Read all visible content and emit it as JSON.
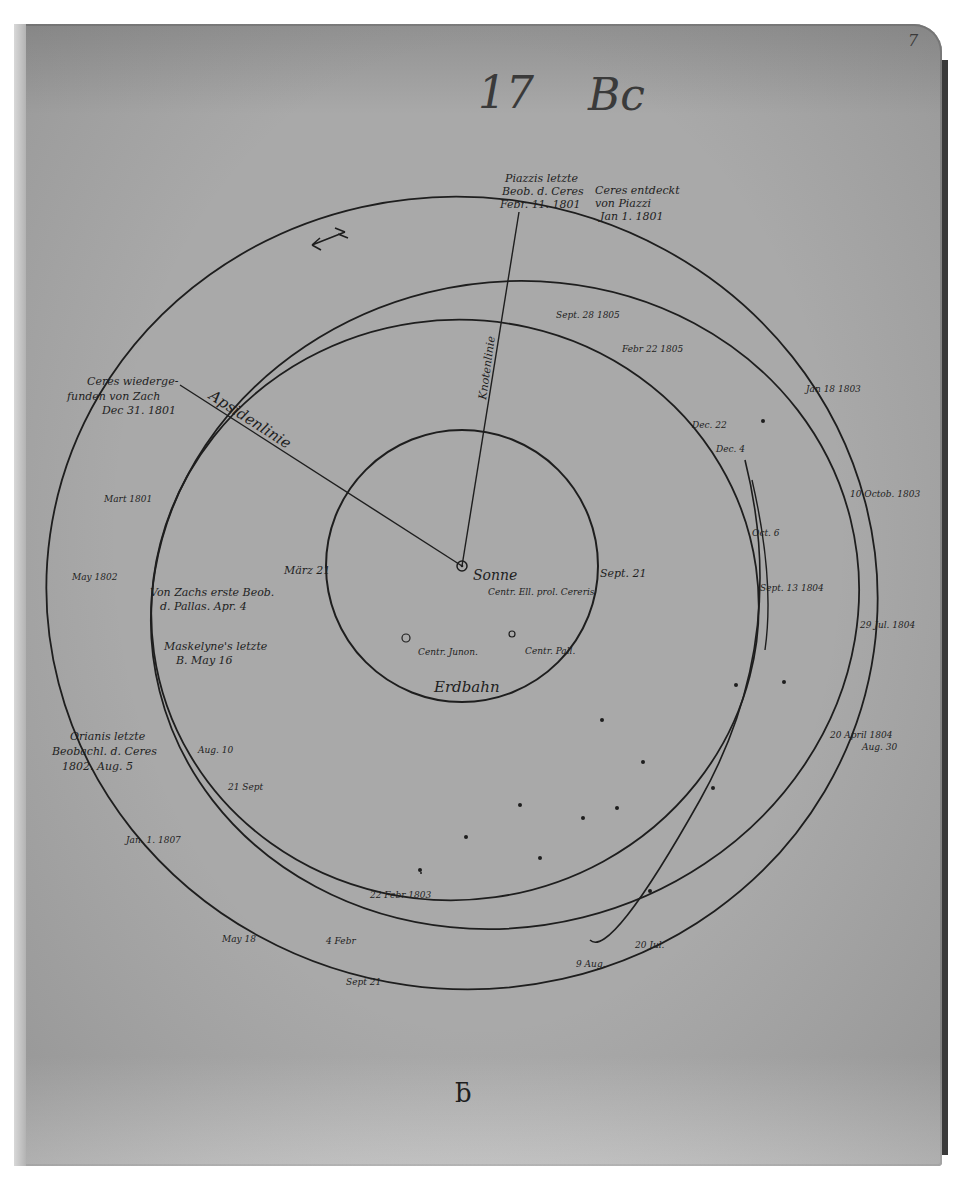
{
  "page": {
    "header_number": "17",
    "header_mark": "Bc",
    "corner_page_number": "7",
    "footer_glyph": "ƃ"
  },
  "diagram": {
    "center_label": "Sonne",
    "earth_orbit_label": "Erdbahn",
    "earth_points": {
      "march": "März 21",
      "sept": "Sept. 21"
    },
    "centers": {
      "ellipse_ceres": "Centr. Ell. prol. Cereris",
      "juno": "Centr. Junon.",
      "pallas": "Centr. Pall."
    },
    "lines": {
      "node_line": "Knotenlinie",
      "apse_line": "Apsidenlinie"
    },
    "annotations": [
      {
        "id": "piazzi-last",
        "lines": [
          "Piazzis letzte",
          "Beob. d. Ceres",
          "Febr. 11. 1801"
        ]
      },
      {
        "id": "ceres-discovered",
        "lines": [
          "Ceres entdeckt",
          "von Piazzi",
          "Jan 1. 1801"
        ]
      },
      {
        "id": "ceres-refound",
        "lines": [
          "Ceres wiederge-",
          "funden von Zach",
          "Dec 31. 1801"
        ]
      },
      {
        "id": "zach-first-pallas",
        "lines": [
          "Von Zachs erste Beob.",
          "d. Pallas. Apr. 4"
        ]
      },
      {
        "id": "maskelyne-last",
        "lines": [
          "Maskelyne's letzte",
          "B. May 16"
        ]
      },
      {
        "id": "orianis-last",
        "lines": [
          "Orianis letzte",
          "Beobachl. d. Ceres",
          "1802. Aug. 5"
        ]
      }
    ],
    "date_ticks": [
      "Sept. 28 1805",
      "Febr 22 1805",
      "Dec. 22",
      "Dec. 4",
      "Jan 18 1803",
      "Oct. 6",
      "Sept. 13 1804",
      "10 Octob. 1803",
      "29 Jul. 1804",
      "20 April 1804",
      "Aug. 30",
      "Mart 1801",
      "May 1802",
      "Aug. 10",
      "21 Sept",
      "Jan. 1. 1807",
      "22 Febr 1803",
      "4 Febr",
      "May 18",
      "Sept 21",
      "9 Aug.",
      "20 Jul."
    ]
  },
  "colors": {
    "paper": "#a9a9a9",
    "ink": "#1e1e1e",
    "pencil": "#3a3a3a",
    "background": "#ffffff",
    "spine": "#3a3a3a"
  }
}
